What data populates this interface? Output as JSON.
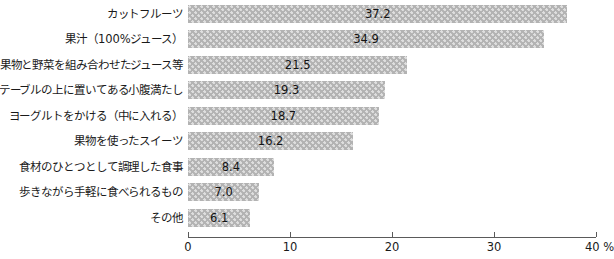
{
  "chart_data": {
    "type": "bar",
    "orientation": "horizontal",
    "title": "",
    "xlabel": "%",
    "ylabel": "",
    "xlim": [
      0,
      40
    ],
    "xticks": [
      0,
      10,
      20,
      30,
      40
    ],
    "xtick_labels": [
      "0",
      "10",
      "20",
      "30",
      "40 %"
    ],
    "grid": false,
    "legend": false,
    "bar_color": "#b3b3b3",
    "bar_pattern": "dotted",
    "axis_color": "#5a5a5a",
    "categories": [
      "カットフルーツ",
      "果汁（100%ジュース）",
      "果物と野菜を組み合わせたジュース等",
      "テーブルの上に置いてある小腹満たし",
      "ヨーグルトをかける（中に入れる）",
      "果物を使ったスイーツ",
      "食材のひとつとして調理した食事",
      "歩きながら手軽に食べられるもの",
      "その他"
    ],
    "values": [
      37.2,
      34.9,
      21.5,
      19.3,
      18.7,
      16.2,
      8.4,
      7.0,
      6.1
    ],
    "value_labels": [
      "37.2",
      "34.9",
      "21.5",
      "19.3",
      "18.7",
      "16.2",
      "8.4",
      "7.0",
      "6.1"
    ]
  }
}
